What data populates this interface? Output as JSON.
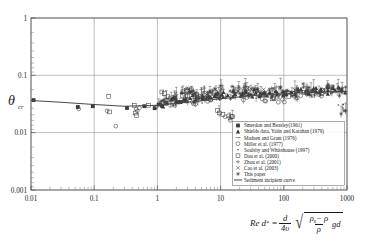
{
  "chart_data": {
    "type": "scatter",
    "title": "",
    "xlabel": "Re d*",
    "xlabel_formula": "Re d* = (d / 4v) * sqrt(((rho_s - rho) / rho) * g * d)",
    "ylabel": "theta_cr",
    "xscale": "log",
    "yscale": "log",
    "xlim": [
      0.01,
      1000
    ],
    "ylim": [
      0.001,
      1
    ],
    "grid": true,
    "x_ticks": [
      "0.01",
      "0.1",
      "1",
      "10",
      "100",
      "1000"
    ],
    "y_ticks": [
      "0.001",
      "0.01",
      "0.1",
      "1"
    ],
    "legend_position": "lower-right-inside",
    "series": [
      {
        "name": "Smerdon and Beasley(1961)",
        "marker": "filled-square",
        "points": [
          [
            0.011,
            0.037
          ],
          [
            0.055,
            0.028
          ],
          [
            0.095,
            0.029
          ],
          [
            0.33,
            0.027
          ],
          [
            0.62,
            0.029
          ],
          [
            1.05,
            0.031
          ],
          [
            2.1,
            0.034
          ]
        ]
      },
      {
        "name": "Shields data, Yalin and Karahan (1979)",
        "marker": "filled-triangle",
        "points": [
          [
            1.4,
            0.033
          ],
          [
            2.0,
            0.036
          ],
          [
            2.6,
            0.038
          ],
          [
            3.3,
            0.04
          ],
          [
            4.1,
            0.042
          ],
          [
            5.2,
            0.041
          ],
          [
            6.5,
            0.044
          ],
          [
            8.0,
            0.043
          ],
          [
            10.5,
            0.046
          ],
          [
            13.0,
            0.045
          ],
          [
            17.0,
            0.047
          ],
          [
            22.0,
            0.048
          ],
          [
            28.0,
            0.047
          ],
          [
            36.0,
            0.05
          ],
          [
            47.0,
            0.049
          ],
          [
            60.0,
            0.051
          ],
          [
            78.0,
            0.05
          ],
          [
            100.0,
            0.052
          ],
          [
            130.0,
            0.051
          ],
          [
            170.0,
            0.053
          ],
          [
            220.0,
            0.052
          ],
          [
            290.0,
            0.054
          ],
          [
            380.0,
            0.053
          ],
          [
            500.0,
            0.055
          ],
          [
            650.0,
            0.054
          ],
          [
            820.0,
            0.056
          ]
        ]
      },
      {
        "name": "Madsen and Grant (1976)",
        "marker": "dash",
        "points": [
          [
            0.9,
            0.03
          ],
          [
            1.6,
            0.032
          ],
          [
            2.8,
            0.036
          ],
          [
            5.0,
            0.039
          ],
          [
            9.0,
            0.042
          ],
          [
            16.0,
            0.044
          ],
          [
            30.0,
            0.047
          ],
          [
            55.0,
            0.048
          ],
          [
            95.0,
            0.05
          ]
        ]
      },
      {
        "name": "Miller et al. (1977)",
        "marker": "open-circle",
        "points": [
          [
            0.057,
            0.026
          ],
          [
            0.16,
            0.024
          ],
          [
            0.22,
            0.013
          ],
          [
            0.46,
            0.026
          ],
          [
            0.48,
            0.024
          ],
          [
            0.52,
            0.027
          ],
          [
            0.95,
            0.028
          ],
          [
            1.9,
            0.03
          ],
          [
            3.6,
            0.034
          ],
          [
            7.0,
            0.037
          ],
          [
            14.0,
            0.018
          ],
          [
            26.0,
            0.041
          ],
          [
            50.0,
            0.036
          ],
          [
            95.0,
            0.038
          ],
          [
            185.0,
            0.044
          ],
          [
            360.0,
            0.046
          ]
        ]
      },
      {
        "name": "Soulsby and Whitehouse (1997)",
        "marker": "dot",
        "points": [
          [
            1.1,
            0.032
          ],
          [
            2.2,
            0.035
          ],
          [
            4.4,
            0.038
          ],
          [
            8.5,
            0.041
          ],
          [
            17.0,
            0.044
          ],
          [
            34.0,
            0.046
          ],
          [
            68.0,
            0.048
          ],
          [
            135.0,
            0.05
          ],
          [
            270.0,
            0.052
          ],
          [
            540.0,
            0.053
          ],
          [
            860.0,
            0.027
          ]
        ]
      },
      {
        "name": "Dou et al. (2000)",
        "marker": "open-square",
        "points": [
          [
            0.17,
            0.043
          ],
          [
            0.175,
            0.023
          ],
          [
            0.43,
            0.03
          ],
          [
            0.45,
            0.022
          ],
          [
            0.47,
            0.02
          ],
          [
            0.72,
            0.03
          ],
          [
            1.3,
            0.048
          ],
          [
            1.35,
            0.036
          ],
          [
            2.5,
            0.045
          ],
          [
            3.0,
            0.052
          ],
          [
            4.2,
            0.047
          ],
          [
            6.0,
            0.04
          ],
          [
            9.5,
            0.022
          ],
          [
            15.0,
            0.019
          ],
          [
            24.0,
            0.052
          ],
          [
            40.0,
            0.046
          ],
          [
            70.0,
            0.039
          ],
          [
            120.0,
            0.043
          ],
          [
            210.0,
            0.05
          ],
          [
            400.0,
            0.048
          ]
        ]
      },
      {
        "name": "Zhou et al. (2001)",
        "marker": "plus",
        "points": [
          [
            1.5,
            0.04
          ],
          [
            2.4,
            0.049
          ],
          [
            3.2,
            0.058
          ],
          [
            4.0,
            0.045
          ],
          [
            5.5,
            0.052
          ],
          [
            7.5,
            0.048
          ],
          [
            11.0,
            0.057
          ],
          [
            16.0,
            0.05
          ],
          [
            23.0,
            0.062
          ],
          [
            33.0,
            0.055
          ],
          [
            48.0,
            0.049
          ],
          [
            70.0,
            0.058
          ],
          [
            105.0,
            0.052
          ],
          [
            160.0,
            0.06
          ],
          [
            240.0,
            0.055
          ],
          [
            360.0,
            0.05
          ],
          [
            560.0,
            0.058
          ],
          [
            800.0,
            0.054
          ]
        ]
      },
      {
        "name": "Cao et al. (2003)",
        "marker": "cross",
        "points": [
          [
            2.0,
            0.044
          ],
          [
            3.5,
            0.051
          ],
          [
            6.0,
            0.046
          ],
          [
            10.0,
            0.055
          ],
          [
            18.0,
            0.049
          ],
          [
            30.0,
            0.058
          ],
          [
            52.0,
            0.051
          ],
          [
            88.0,
            0.046
          ],
          [
            150.0,
            0.056
          ],
          [
            250.0,
            0.05
          ],
          [
            430.0,
            0.057
          ],
          [
            700.0,
            0.052
          ]
        ]
      },
      {
        "name": "This paper",
        "marker": "star",
        "points": [
          [
            1.2,
            0.036
          ],
          [
            1.8,
            0.042
          ],
          [
            2.8,
            0.039
          ],
          [
            3.8,
            0.048
          ],
          [
            5.0,
            0.043
          ],
          [
            6.8,
            0.053
          ],
          [
            9.0,
            0.046
          ],
          [
            12.0,
            0.041
          ],
          [
            16.0,
            0.055
          ],
          [
            21.0,
            0.048
          ],
          [
            28.0,
            0.043
          ],
          [
            38.0,
            0.057
          ],
          [
            50.0,
            0.05
          ],
          [
            66.0,
            0.045
          ],
          [
            88.0,
            0.06
          ],
          [
            115.0,
            0.053
          ],
          [
            155.0,
            0.047
          ],
          [
            205.0,
            0.062
          ],
          [
            270.0,
            0.055
          ],
          [
            360.0,
            0.049
          ],
          [
            480.0,
            0.063
          ],
          [
            630.0,
            0.056
          ],
          [
            830.0,
            0.05
          ],
          [
            950.0,
            0.024
          ]
        ]
      }
    ],
    "fitted_curve": {
      "name": "Sediment incipient curve",
      "points": [
        [
          0.01,
          0.0365
        ],
        [
          0.03,
          0.034
        ],
        [
          0.1,
          0.031
        ],
        [
          0.3,
          0.0288
        ],
        [
          1.0,
          0.03
        ],
        [
          3.0,
          0.034
        ],
        [
          10.0,
          0.039
        ],
        [
          30.0,
          0.044
        ],
        [
          100.0,
          0.0478
        ],
        [
          300.0,
          0.0505
        ],
        [
          1000.0,
          0.0525
        ]
      ]
    }
  },
  "legend": {
    "entries": [
      {
        "label": "Smerdon and Beasley(1961)",
        "marker": "filled-square"
      },
      {
        "label": "Shields data, Yalin and Karahan (1979)",
        "marker": "filled-triangle"
      },
      {
        "label": "Madsen and Grant (1976)",
        "marker": "dash"
      },
      {
        "label": "Miller et al. (1977)",
        "marker": "open-circle"
      },
      {
        "label": "Soulsby and Whitehouse (1997)",
        "marker": "dot"
      },
      {
        "label": "Dou et al. (2000)",
        "marker": "open-square"
      },
      {
        "label": "Zhou et al. (2001)",
        "marker": "plus"
      },
      {
        "label": "Cao et al. (2003)",
        "marker": "cross"
      },
      {
        "label": "This paper",
        "marker": "star"
      },
      {
        "label": "Sediment incipient curve",
        "marker": "line"
      }
    ]
  },
  "axis_label_y": {
    "symbol": "θ",
    "subscript": "cr"
  },
  "formula": {
    "lhs_re": "Re",
    "lhs_d": "d",
    "lhs_sub": "*",
    "equals": "=",
    "frac_num": "d",
    "frac_den": "4υ",
    "radical_num": "ρ",
    "radical_num_sub": "s",
    "radical_num_minus": "− ρ",
    "radical_den": "ρ",
    "radical_tail": "gd"
  }
}
